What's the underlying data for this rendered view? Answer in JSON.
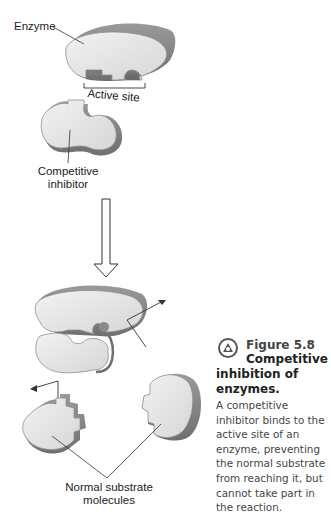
{
  "labels": {
    "enzyme": "Enzyme",
    "active_site": "Active site",
    "competitive_inhibitor_line1": "Competitive",
    "competitive_inhibitor_line2": "inhibitor",
    "normal_substrate_line1": "Normal substrate",
    "normal_substrate_line2": "molecules"
  },
  "caption": {
    "icon": "figure-swirl-icon",
    "figure_number": "Figure 5.8",
    "title_line1": "Competitive",
    "title_rest": "inhibition of enzymes.",
    "body": "A competitive inhibitor binds to the active site of an enzyme, preventing the normal substrate from reaching it, but cannot take part in the reaction."
  },
  "colors": {
    "shape_fill": "#e6e6e6",
    "shape_edge": "#8f8f8f",
    "shape_side": "#b5b5b5",
    "line": "#333333",
    "text": "#222222",
    "caption_text": "#444444"
  }
}
